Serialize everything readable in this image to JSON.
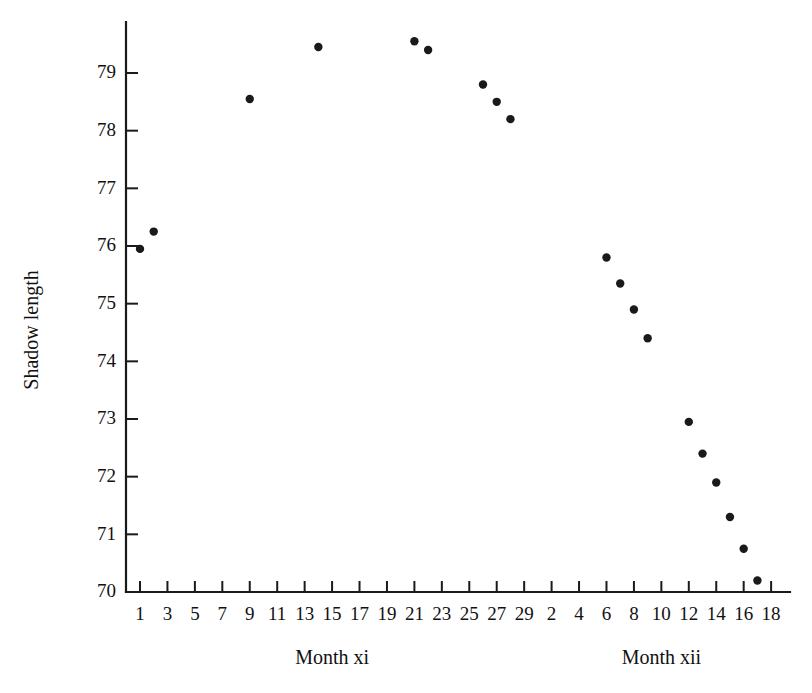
{
  "chart_data": {
    "type": "scatter",
    "title": "",
    "xlabel": "",
    "ylabel": "Shadow length",
    "ylim": [
      70,
      79.8
    ],
    "yticks": [
      70,
      71,
      72,
      73,
      74,
      75,
      76,
      77,
      78,
      79
    ],
    "ytick_labels": [
      "70",
      "71",
      "72",
      "73",
      "74",
      "75",
      "76",
      "77",
      "78",
      "79"
    ],
    "grid": false,
    "legend": "none",
    "panels": [
      {
        "label": "Month xi",
        "tick_labels": [
          "1",
          "3",
          "5",
          "7",
          "9",
          "11",
          "13",
          "15",
          "17",
          "19",
          "21",
          "23",
          "25",
          "27",
          "29"
        ]
      },
      {
        "label": "Month xii",
        "tick_labels": [
          "2",
          "4",
          "6",
          "8",
          "10",
          "12",
          "14",
          "16",
          "18"
        ]
      }
    ],
    "x_tick_labels_all": [
      "1",
      "3",
      "5",
      "7",
      "9",
      "11",
      "13",
      "15",
      "17",
      "19",
      "21",
      "23",
      "25",
      "27",
      "29",
      "2",
      "4",
      "6",
      "8",
      "10",
      "12",
      "14",
      "16",
      "18"
    ],
    "series": [
      {
        "name": "Shadow length",
        "marker": "filled-circle",
        "color": "#1a1a1a",
        "points": [
          {
            "x": 1,
            "panel": "xi",
            "y": 75.95
          },
          {
            "x": 2,
            "panel": "xi",
            "y": 76.25
          },
          {
            "x": 9,
            "panel": "xi",
            "y": 78.55
          },
          {
            "x": 14,
            "panel": "xi",
            "y": 79.45
          },
          {
            "x": 21,
            "panel": "xi",
            "y": 79.55
          },
          {
            "x": 22,
            "panel": "xi",
            "y": 79.4
          },
          {
            "x": 26,
            "panel": "xi",
            "y": 78.8
          },
          {
            "x": 27,
            "panel": "xi",
            "y": 78.5
          },
          {
            "x": 28,
            "panel": "xi",
            "y": 78.2
          },
          {
            "x": 6,
            "panel": "xii",
            "y": 75.8
          },
          {
            "x": 7,
            "panel": "xii",
            "y": 75.35
          },
          {
            "x": 8,
            "panel": "xii",
            "y": 74.9
          },
          {
            "x": 9,
            "panel": "xii",
            "y": 74.4
          },
          {
            "x": 12,
            "panel": "xii",
            "y": 72.95
          },
          {
            "x": 13,
            "panel": "xii",
            "y": 72.4
          },
          {
            "x": 14,
            "panel": "xii",
            "y": 71.9
          },
          {
            "x": 15,
            "panel": "xii",
            "y": 71.3
          },
          {
            "x": 16,
            "panel": "xii",
            "y": 70.75
          },
          {
            "x": 17,
            "panel": "xii",
            "y": 70.2
          }
        ]
      }
    ],
    "colors": {
      "ink": "#1a1a1a",
      "background": "#ffffff"
    }
  }
}
